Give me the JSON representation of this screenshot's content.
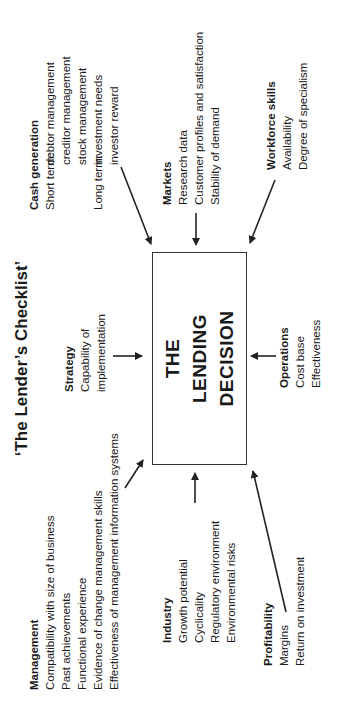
{
  "title": "‘The Lender’s Checklist’",
  "center_box": {
    "lines": [
      "THE",
      "LENDING",
      "DECISION"
    ]
  },
  "blocks": {
    "management": {
      "heading": "Management",
      "items": [
        "Compatibility with size of business",
        "Past achievements",
        "Functional experience",
        "Evidence of change management skills",
        "Effectiveness of management information systems"
      ]
    },
    "strategy": {
      "heading": "Strategy",
      "items": [
        "Capability of",
        "implementation"
      ]
    },
    "cash_generation": {
      "heading": "Cash generation",
      "short_term_label": "Short term:",
      "short_term_items": [
        "debtor management",
        "creditor management",
        "stock management"
      ],
      "long_term_label": "Long term:",
      "long_term_items": [
        "investment needs",
        "investor reward"
      ]
    },
    "industry": {
      "heading": "Industry",
      "items": [
        "Growth potential",
        "Cyclicality",
        "Regulatory environment",
        "Environmental risks"
      ]
    },
    "markets": {
      "heading": "Markets",
      "items": [
        "Research data",
        "Customer profiles and satisfaction",
        "Stability of demand"
      ]
    },
    "profitability": {
      "heading": "Profitability",
      "items": [
        "Margins",
        "Return on investment"
      ]
    },
    "operations": {
      "heading": "Operations",
      "items": [
        "Cost base",
        "Effectiveness"
      ]
    },
    "workforce_skills": {
      "heading": "Workforce skills",
      "items": [
        "Availability",
        "Degree of specialism"
      ]
    }
  },
  "colors": {
    "text": "#1a1a1a",
    "lines": "#222222",
    "background": "#ffffff"
  }
}
